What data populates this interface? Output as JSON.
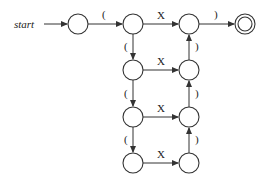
{
  "diagram": {
    "type": "finite-automaton",
    "start_label": "start",
    "states": [
      {
        "id": "s0",
        "x": 78,
        "y": 24,
        "accepting": false,
        "initial": true
      },
      {
        "id": "a1",
        "x": 133,
        "y": 24,
        "accepting": false
      },
      {
        "id": "b1",
        "x": 189,
        "y": 24,
        "accepting": false
      },
      {
        "id": "f",
        "x": 245,
        "y": 24,
        "accepting": true
      },
      {
        "id": "a2",
        "x": 133,
        "y": 70,
        "accepting": false
      },
      {
        "id": "b2",
        "x": 189,
        "y": 70,
        "accepting": false
      },
      {
        "id": "a3",
        "x": 133,
        "y": 117,
        "accepting": false
      },
      {
        "id": "b3",
        "x": 189,
        "y": 117,
        "accepting": false
      },
      {
        "id": "a4",
        "x": 133,
        "y": 163,
        "accepting": false
      },
      {
        "id": "b4",
        "x": 189,
        "y": 163,
        "accepting": false
      }
    ],
    "transitions": [
      {
        "from": "s0",
        "to": "a1",
        "label": "("
      },
      {
        "from": "a1",
        "to": "b1",
        "label": "X"
      },
      {
        "from": "b1",
        "to": "f",
        "label": ")"
      },
      {
        "from": "a1",
        "to": "a2",
        "label": "("
      },
      {
        "from": "a2",
        "to": "b2",
        "label": "X"
      },
      {
        "from": "b2",
        "to": "b1",
        "label": ")"
      },
      {
        "from": "a2",
        "to": "a3",
        "label": "("
      },
      {
        "from": "a3",
        "to": "b3",
        "label": "X"
      },
      {
        "from": "b3",
        "to": "b2",
        "label": ")"
      },
      {
        "from": "a3",
        "to": "a4",
        "label": "("
      },
      {
        "from": "a4",
        "to": "b4",
        "label": "X"
      },
      {
        "from": "b4",
        "to": "b3",
        "label": ")"
      }
    ],
    "labels": {
      "open": "(",
      "close": ")",
      "x": "X"
    }
  }
}
